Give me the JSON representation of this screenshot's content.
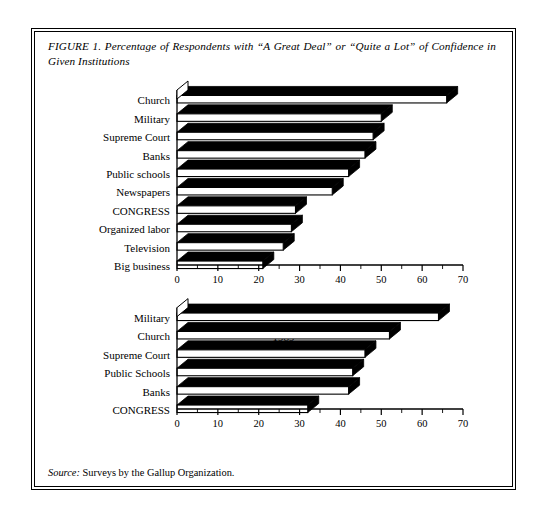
{
  "figure": {
    "caption": "FIGURE 1. Percentage of Respondents with “A Great Deal” or “Quite a Lot” of Confidence in Given Institutions",
    "source_label": "Source:",
    "source_text": " Surveys by the Gallup Organization."
  },
  "chart_data": [
    {
      "type": "bar",
      "orientation": "horizontal",
      "title": "1981",
      "xlabel": "",
      "ylabel": "",
      "xlim": [
        0,
        70
      ],
      "xticks": [
        0,
        10,
        20,
        30,
        40,
        50,
        60,
        70
      ],
      "xtick_labels": [
        "0",
        "10",
        "20",
        "30",
        "40",
        "50",
        "60",
        "70"
      ],
      "minor_tick_step": 5,
      "grid": false,
      "legend": "none",
      "categories": [
        "Church",
        "Military",
        "Supreme Court",
        "Banks",
        "Public schools",
        "Newspapers",
        "CONGRESS",
        "Organized labor",
        "Television",
        "Big business"
      ],
      "values": [
        66,
        50,
        48,
        46,
        42,
        38,
        29,
        28,
        26,
        21
      ]
    },
    {
      "type": "bar",
      "orientation": "horizontal",
      "title": "1989",
      "xlabel": "",
      "ylabel": "",
      "xlim": [
        0,
        70
      ],
      "xticks": [
        0,
        10,
        20,
        30,
        40,
        50,
        60,
        70
      ],
      "xtick_labels": [
        "0",
        "10",
        "20",
        "30",
        "40",
        "50",
        "60",
        "70"
      ],
      "minor_tick_step": 5,
      "grid": false,
      "legend": "none",
      "categories": [
        "Military",
        "Church",
        "Supreme Court",
        "Public Schools",
        "Banks",
        "CONGRESS"
      ],
      "values": [
        64,
        52,
        46,
        43,
        42,
        32
      ]
    }
  ],
  "style": {
    "bar_face": "#ffffff",
    "bar_outline": "#000000",
    "bar_shadow": "#000000",
    "axis_color": "#000000",
    "background": "#ffffff"
  }
}
